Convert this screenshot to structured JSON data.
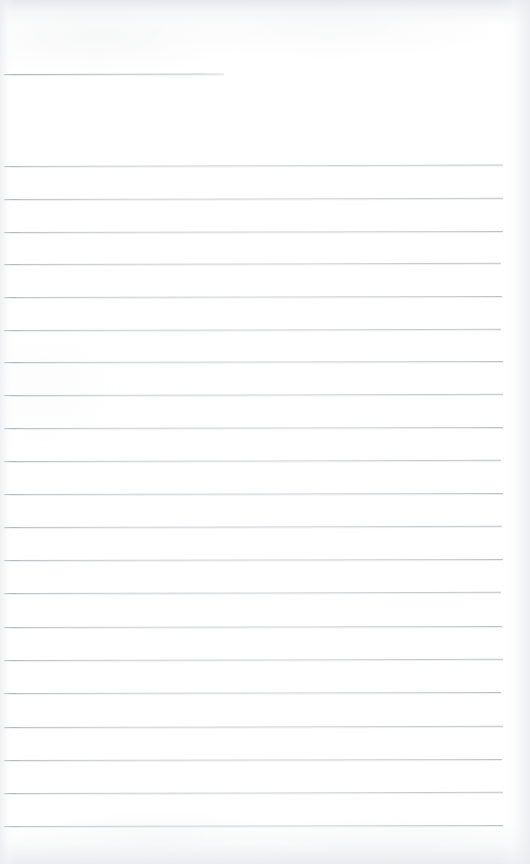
{
  "document": {
    "kind": "scanned-ruled-notebook-page",
    "description": "Blank lined notebook paper scan",
    "page_width": 530,
    "page_height": 864,
    "background_color": "#ffffff",
    "rule_color": "#c7cbd0",
    "rule_color_dark": "#969ba1",
    "content_text": ""
  },
  "header_rule": {
    "label": "header-underline",
    "x": 4,
    "y": 74,
    "width": 220,
    "skew_deg": -0.12
  },
  "ruling": {
    "line_count": 21,
    "left_margin": 4,
    "right_edge": 503,
    "first_line_y": 166,
    "line_spacing": 33,
    "thickness": 1,
    "lines": [
      {
        "index": 1,
        "y": 166,
        "x": 4,
        "width": 499,
        "skew_deg": -0.16
      },
      {
        "index": 2,
        "y": 199,
        "x": 4,
        "width": 499,
        "skew_deg": -0.14
      },
      {
        "index": 3,
        "y": 232,
        "x": 4,
        "width": 499,
        "skew_deg": -0.12
      },
      {
        "index": 4,
        "y": 264,
        "x": 4,
        "width": 497,
        "skew_deg": -0.14
      },
      {
        "index": 5,
        "y": 297,
        "x": 4,
        "width": 498,
        "skew_deg": -0.12
      },
      {
        "index": 6,
        "y": 330,
        "x": 4,
        "width": 497,
        "skew_deg": -0.14
      },
      {
        "index": 7,
        "y": 362,
        "x": 4,
        "width": 499,
        "skew_deg": -0.12
      },
      {
        "index": 8,
        "y": 395,
        "x": 4,
        "width": 499,
        "skew_deg": -0.14
      },
      {
        "index": 9,
        "y": 428,
        "x": 4,
        "width": 499,
        "skew_deg": -0.12
      },
      {
        "index": 10,
        "y": 461,
        "x": 4,
        "width": 497,
        "skew_deg": -0.14
      },
      {
        "index": 11,
        "y": 494,
        "x": 4,
        "width": 499,
        "skew_deg": -0.12
      },
      {
        "index": 12,
        "y": 527,
        "x": 4,
        "width": 498,
        "skew_deg": -0.14
      },
      {
        "index": 13,
        "y": 560,
        "x": 4,
        "width": 499,
        "skew_deg": -0.12
      },
      {
        "index": 14,
        "y": 593,
        "x": 4,
        "width": 497,
        "skew_deg": -0.14
      },
      {
        "index": 15,
        "y": 627,
        "x": 4,
        "width": 498,
        "skew_deg": -0.12
      },
      {
        "index": 16,
        "y": 660,
        "x": 4,
        "width": 499,
        "skew_deg": -0.14
      },
      {
        "index": 17,
        "y": 693,
        "x": 4,
        "width": 497,
        "skew_deg": -0.12
      },
      {
        "index": 18,
        "y": 727,
        "x": 4,
        "width": 499,
        "skew_deg": -0.14
      },
      {
        "index": 19,
        "y": 760,
        "x": 4,
        "width": 498,
        "skew_deg": -0.12
      },
      {
        "index": 20,
        "y": 793,
        "x": 4,
        "width": 499,
        "skew_deg": -0.14
      },
      {
        "index": 21,
        "y": 826,
        "x": 4,
        "width": 499,
        "skew_deg": -0.12
      }
    ]
  }
}
